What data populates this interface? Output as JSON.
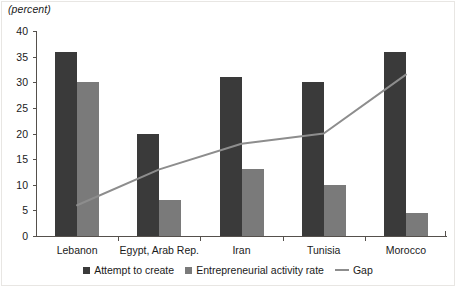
{
  "chart_data": {
    "type": "bar",
    "title": "",
    "xlabel": "",
    "ylabel": "(percent)",
    "ylim": [
      0,
      40
    ],
    "yticks": [
      0,
      5,
      10,
      15,
      20,
      25,
      30,
      35,
      40
    ],
    "grid": false,
    "legend_position": "bottom",
    "categories": [
      "Lebanon",
      "Egypt, Arab Rep.",
      "Iran",
      "Tunisia",
      "Morocco"
    ],
    "series": [
      {
        "name": "Attempt to create",
        "type": "bar",
        "color": "#3a3a3a",
        "values": [
          36,
          20,
          31,
          30,
          36
        ]
      },
      {
        "name": "Entrepreneurial activity rate",
        "type": "bar",
        "color": "#7a7a7a",
        "values": [
          30,
          7,
          13,
          10,
          4.5
        ]
      },
      {
        "name": "Gap",
        "type": "line",
        "color": "#8d8d8d",
        "values": [
          6,
          13,
          18,
          20,
          31.5
        ]
      }
    ]
  },
  "legend": {
    "items": [
      {
        "label": "Attempt to create",
        "marker": "square-dark-icon"
      },
      {
        "label": "Entrepreneurial activity rate",
        "marker": "square-gray-icon"
      },
      {
        "label": "Gap",
        "marker": "line-gray-icon"
      }
    ]
  }
}
